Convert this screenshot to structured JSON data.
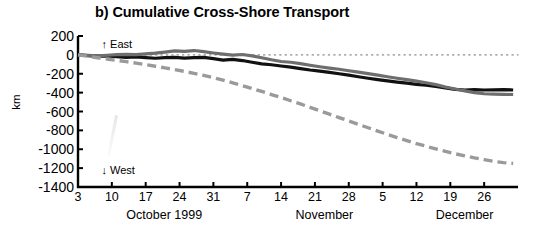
{
  "figure": {
    "panel_label": "b)",
    "title": "b) Cumulative Cross-Shore Transport",
    "ylabel": "km",
    "annotation_east": "↑ East",
    "annotation_west": "↓ West"
  },
  "chart_data": {
    "type": "line",
    "title": "b) Cumulative Cross-Shore Transport",
    "xlabel": "",
    "ylabel": "km",
    "ylim": [
      -1400,
      200
    ],
    "yticks": [
      200,
      0,
      -200,
      -400,
      -600,
      -800,
      -1000,
      -1200,
      -1400
    ],
    "ytick_labels": [
      "200",
      "0",
      "-200",
      "-400",
      "-600",
      "-800",
      "-1000",
      "-1200",
      "-1400"
    ],
    "xlim": [
      0,
      91
    ],
    "xticks": [
      0,
      7,
      14,
      21,
      28,
      35,
      42,
      49,
      56,
      63,
      70,
      77,
      84
    ],
    "xtick_labels": [
      "3",
      "10",
      "17",
      "24",
      "31",
      "7",
      "14",
      "21",
      "28",
      "5",
      "12",
      "19",
      "26"
    ],
    "month_labels": [
      {
        "text": "October 1999",
        "x": 10
      },
      {
        "text": "November",
        "x": 45
      },
      {
        "text": "December",
        "x": 74
      }
    ],
    "grid": false,
    "legend": "none",
    "reference_lines": [
      {
        "y": 0,
        "style": "dotted",
        "color": "#8c8c8c"
      }
    ],
    "annotations": [
      {
        "text": "↑ East",
        "x": 3,
        "y": 105
      },
      {
        "text": "↓ West",
        "x": 3,
        "y": -1235
      }
    ],
    "colors": {
      "series_black": "#111111",
      "series_gray": "#6e6e6e",
      "series_dashed": "#9a9a9a",
      "axis": "#000000",
      "zero_line": "#8c8c8c"
    },
    "x": [
      0,
      2,
      4,
      6,
      8,
      10,
      12,
      14,
      16,
      18,
      20,
      22,
      24,
      26,
      28,
      30,
      32,
      34,
      36,
      38,
      40,
      42,
      44,
      46,
      48,
      50,
      52,
      54,
      56,
      58,
      60,
      62,
      64,
      66,
      68,
      70,
      72,
      74,
      76,
      78,
      80,
      82,
      84,
      86,
      88,
      90
    ],
    "series": [
      {
        "name": "black-solid",
        "style": "solid",
        "color": "#111111",
        "width": 3.2,
        "values": [
          0,
          -8,
          -14,
          -10,
          -20,
          -26,
          -22,
          -30,
          -36,
          -30,
          -26,
          -34,
          -30,
          -26,
          -40,
          -55,
          -48,
          -60,
          -78,
          -95,
          -105,
          -118,
          -130,
          -145,
          -160,
          -172,
          -185,
          -200,
          -215,
          -232,
          -248,
          -262,
          -275,
          -288,
          -300,
          -312,
          -322,
          -335,
          -350,
          -365,
          -372,
          -368,
          -372,
          -370,
          -368,
          -372
        ]
      },
      {
        "name": "gray-solid",
        "style": "solid",
        "color": "#6e6e6e",
        "width": 3.2,
        "values": [
          0,
          -5,
          -10,
          -4,
          2,
          6,
          2,
          10,
          18,
          30,
          42,
          38,
          46,
          34,
          20,
          8,
          -2,
          4,
          -10,
          -30,
          -52,
          -70,
          -78,
          -92,
          -110,
          -126,
          -140,
          -152,
          -168,
          -182,
          -198,
          -215,
          -232,
          -248,
          -262,
          -278,
          -295,
          -315,
          -340,
          -362,
          -382,
          -400,
          -412,
          -416,
          -418,
          -420
        ]
      },
      {
        "name": "gray-dashed",
        "style": "dashed",
        "color": "#9a9a9a",
        "width": 3.4,
        "values": [
          0,
          -14,
          -30,
          -44,
          -58,
          -72,
          -88,
          -104,
          -120,
          -138,
          -156,
          -175,
          -196,
          -218,
          -242,
          -268,
          -296,
          -326,
          -356,
          -388,
          -420,
          -452,
          -486,
          -520,
          -556,
          -592,
          -628,
          -665,
          -700,
          -736,
          -772,
          -808,
          -842,
          -876,
          -908,
          -940,
          -968,
          -996,
          -1022,
          -1048,
          -1070,
          -1092,
          -1110,
          -1128,
          -1142,
          -1150
        ]
      }
    ]
  }
}
